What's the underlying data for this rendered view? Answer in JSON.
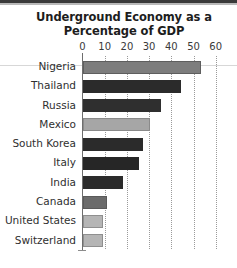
{
  "chart_data": {
    "type": "bar",
    "orientation": "horizontal",
    "title": "Underground Economy as a Percentage of GDP",
    "title_lines": [
      "Underground Economy as a",
      "Percentage of GDP"
    ],
    "xlabel": "",
    "ylabel": "",
    "xlim": [
      0,
      60
    ],
    "xticks": [
      0,
      10,
      20,
      30,
      40,
      50,
      60
    ],
    "xtick_labels": [
      "0",
      "10",
      "20",
      "30",
      "40",
      "50",
      "60"
    ],
    "grid": "vertical-dotted",
    "legend": null,
    "categories": [
      "Nigeria",
      "Thailand",
      "Russia",
      "Mexico",
      "South Korea",
      "Italy",
      "India",
      "Canada",
      "United States",
      "Switzerland"
    ],
    "values": [
      53,
      44,
      35,
      30,
      27,
      25,
      18,
      11,
      9,
      9
    ],
    "bars": [
      {
        "category": "Nigeria",
        "value": 53,
        "color": "#7d7d7d",
        "border": "#5e5e5e"
      },
      {
        "category": "Thailand",
        "value": 44,
        "color": "#2b2b2b",
        "border": "#2b2b2b"
      },
      {
        "category": "Russia",
        "value": 35,
        "color": "#2f2f2f",
        "border": "#2f2f2f"
      },
      {
        "category": "Mexico",
        "value": 30,
        "color": "#a6a6a6",
        "border": "#8a8a8a"
      },
      {
        "category": "South Korea",
        "value": 27,
        "color": "#2b2b2b",
        "border": "#2b2b2b"
      },
      {
        "category": "Italy",
        "value": 25,
        "color": "#262626",
        "border": "#262626"
      },
      {
        "category": "India",
        "value": 18,
        "color": "#2b2b2b",
        "border": "#2b2b2b"
      },
      {
        "category": "Canada",
        "value": 11,
        "color": "#6b6b6b",
        "border": "#5a5a5a"
      },
      {
        "category": "United States",
        "value": 9,
        "color": "#b5b5b5",
        "border": "#8f8f8f"
      },
      {
        "category": "Switzerland",
        "value": 9,
        "color": "#b5b5b5",
        "border": "#8f8f8f"
      }
    ]
  }
}
